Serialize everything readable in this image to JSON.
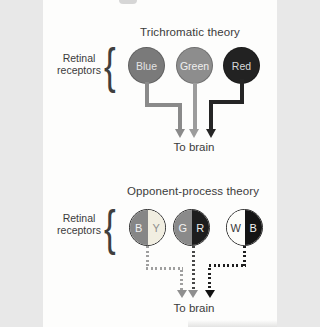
{
  "figure": {
    "background": "#fdfdfc",
    "text_color": "#3b3b3b",
    "brace_char": "{",
    "brace_color": "#3f3f3f"
  },
  "trichromatic": {
    "title": "Trichromatic theory",
    "side_label_line1": "Retinal",
    "side_label_line2": "receptors",
    "to_brain": "To brain",
    "receptors": [
      {
        "name": "blue",
        "label": "Blue",
        "fill": "#7a7a7a",
        "label_color": "#e4e4e4",
        "arrow_color": "#8a8a8a"
      },
      {
        "name": "green",
        "label": "Green",
        "fill": "#8d8d8d",
        "label_color": "#f0f0f0",
        "arrow_color": "#9c9c9c"
      },
      {
        "name": "red",
        "label": "Red",
        "fill": "#222222",
        "label_color": "#d9d9d9",
        "arrow_color": "#252525"
      }
    ]
  },
  "opponent": {
    "title": "Opponent-process theory",
    "side_label_line1": "Retinal",
    "side_label_line2": "receptors",
    "to_brain": "To brain",
    "receptors": [
      {
        "name": "blue-yellow",
        "left_letter": "B",
        "right_letter": "Y",
        "left_fill": "#868686",
        "right_fill": "#f1eee1",
        "left_letter_color": "#f2f2f2",
        "right_letter_color": "#8e8e8e",
        "path_color": "#9f9f9f",
        "head_color": "#8f8f8f"
      },
      {
        "name": "green-red",
        "left_letter": "G",
        "right_letter": "R",
        "left_fill": "#8a8a8a",
        "right_fill": "#1d1d1d",
        "left_letter_color": "#f2f2f2",
        "right_letter_color": "#eaeaea",
        "path_color": "#474747",
        "head_color": "#8f8f8f"
      },
      {
        "name": "white-black",
        "left_letter": "W",
        "right_letter": "B",
        "left_fill": "#fdfdfa",
        "right_fill": "#141414",
        "left_letter_color": "#3a3a3a",
        "right_letter_color": "#f2f2f2",
        "path_color": "#1e1e1e",
        "head_color": "#111111"
      }
    ]
  }
}
